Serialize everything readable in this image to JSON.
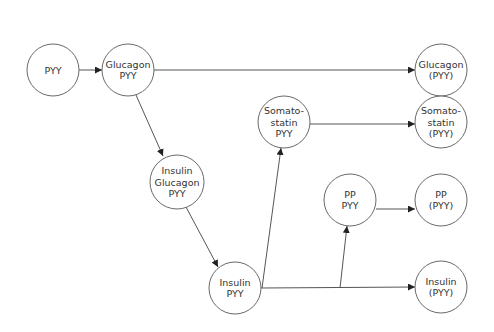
{
  "diagram": {
    "type": "flow",
    "nodes": [
      {
        "id": "pyy",
        "lines": [
          "PYY"
        ],
        "cx": 53,
        "cy": 70,
        "r": 26
      },
      {
        "id": "glucagon_pyy",
        "lines": [
          "Glucagon",
          "PYY"
        ],
        "cx": 128,
        "cy": 70,
        "r": 26
      },
      {
        "id": "glucagon_pyy_out",
        "lines": [
          "Glucagon",
          "(PYY)"
        ],
        "cx": 441,
        "cy": 70,
        "r": 26
      },
      {
        "id": "insulin_glucagon_pyy",
        "lines": [
          "Insulin",
          "Glucagon",
          "PYY"
        ],
        "cx": 177,
        "cy": 182,
        "r": 27
      },
      {
        "id": "somatostatin_pyy",
        "lines": [
          "Somato-",
          "statin",
          "PYY"
        ],
        "cx": 284,
        "cy": 122,
        "r": 26
      },
      {
        "id": "somatostatin_pyy_out",
        "lines": [
          "Somato-",
          "statin",
          "(PYY)"
        ],
        "cx": 441,
        "cy": 122,
        "r": 26
      },
      {
        "id": "pp_pyy",
        "lines": [
          "PP",
          "PYY"
        ],
        "cx": 350,
        "cy": 200,
        "r": 26
      },
      {
        "id": "pp_pyy_out",
        "lines": [
          "PP",
          "(PYY)"
        ],
        "cx": 441,
        "cy": 200,
        "r": 26
      },
      {
        "id": "insulin_pyy",
        "lines": [
          "Insulin",
          "PYY"
        ],
        "cx": 235,
        "cy": 288,
        "r": 26
      },
      {
        "id": "insulin_pyy_out",
        "lines": [
          "Insulin",
          "(PYY)"
        ],
        "cx": 441,
        "cy": 287,
        "r": 26
      }
    ],
    "edges": [
      {
        "from": "pyy",
        "to": "glucagon_pyy",
        "path": [
          [
            79,
            70
          ],
          [
            102,
            70
          ]
        ],
        "arrow": true
      },
      {
        "from": "glucagon_pyy",
        "to": "glucagon_pyy_out",
        "path": [
          [
            154,
            70
          ],
          [
            415,
            70
          ]
        ],
        "arrow": true
      },
      {
        "from": "glucagon_pyy",
        "to": "insulin_glucagon_pyy",
        "path": [
          [
            136,
            95
          ],
          [
            163,
            156
          ]
        ],
        "arrow": true
      },
      {
        "from": "insulin_glucagon_pyy",
        "to": "insulin_pyy",
        "path": [
          [
            186,
            207
          ],
          [
            218,
            267
          ]
        ],
        "arrow": true
      },
      {
        "from": "somatostatin_pyy",
        "to": "somatostatin_pyy_out",
        "path": [
          [
            310,
            124
          ],
          [
            415,
            124
          ]
        ],
        "arrow": true
      },
      {
        "from": "pp_pyy",
        "to": "pp_pyy_out",
        "path": [
          [
            376,
            209
          ],
          [
            415,
            209
          ]
        ],
        "arrow": true
      },
      {
        "from": "insulin_pyy",
        "to": "insulin_pyy_out",
        "path": [
          [
            261,
            288
          ],
          [
            415,
            287
          ]
        ],
        "arrow": true
      },
      {
        "from": "insulin_pyy",
        "to": "somatostatin_pyy",
        "path": [
          [
            262,
            288
          ],
          [
            281,
            148
          ]
        ],
        "arrow": true
      },
      {
        "from": "insulin_pyy",
        "to": "pp_pyy",
        "path": [
          [
            340,
            288
          ],
          [
            347,
            226
          ]
        ],
        "arrow": true
      }
    ]
  }
}
